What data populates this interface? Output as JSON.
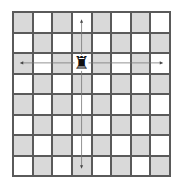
{
  "board": {
    "rows": 8,
    "cols": 8,
    "top_left_color": "dark",
    "colors": {
      "dark": "#d9d9d9",
      "light": "#ffffff",
      "grid": "#5a5a5a",
      "arrow": "#777777"
    }
  },
  "pieces": [
    {
      "type": "rook",
      "color": "black",
      "row": 2,
      "col": 3,
      "glyph": "♜"
    }
  ],
  "move_arrows": [
    {
      "direction": "up",
      "from": [
        2,
        3
      ],
      "to": [
        0,
        3
      ]
    },
    {
      "direction": "down",
      "from": [
        2,
        3
      ],
      "to": [
        7,
        3
      ]
    },
    {
      "direction": "left",
      "from": [
        2,
        3
      ],
      "to": [
        2,
        0
      ]
    },
    {
      "direction": "right",
      "from": [
        2,
        3
      ],
      "to": [
        2,
        7
      ]
    }
  ]
}
